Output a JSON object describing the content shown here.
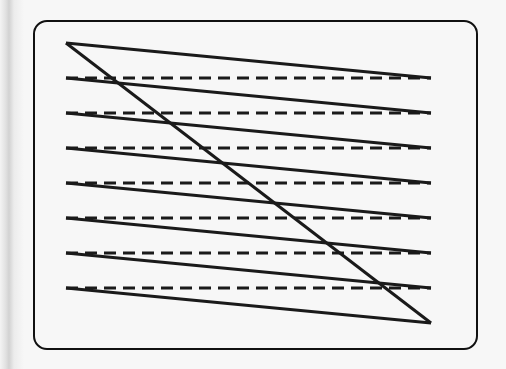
{
  "diagram": {
    "type": "raster-scan-pattern",
    "frame": {
      "x": 34,
      "y": 21,
      "width": 443,
      "height": 328,
      "radius": 13
    },
    "left_x": 66,
    "right_x": 431,
    "top_y": 43,
    "bottom_y": 323,
    "scan_rows_y": [
      78,
      113,
      148,
      183,
      218,
      253,
      288
    ],
    "colors": {
      "line": "#1a1a1a",
      "frame": "#111111",
      "fill": "#f7f7f7"
    }
  }
}
